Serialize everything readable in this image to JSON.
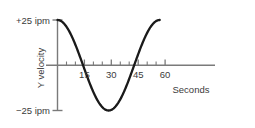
{
  "chart_data": {
    "type": "line",
    "title": "",
    "xlabel": "Seconds",
    "ylabel": "Y velocity",
    "ylim": [
      -25,
      25
    ],
    "xlim": [
      0,
      62
    ],
    "grid": false,
    "legend": null,
    "y_axis_top_label": "+25 ipm",
    "y_axis_bottom_label": "−25 ipm",
    "x_tick_labels": [
      "15",
      "30",
      "45",
      "60"
    ],
    "x_tick_values": [
      15,
      30,
      45,
      60
    ],
    "x_minor_tick_values": [
      5,
      10,
      20,
      25,
      35,
      40,
      50,
      55
    ],
    "series": [
      {
        "name": "Y velocity",
        "description": "cosine wave, amplitude 25 ipm, period 57 s, starting at +25 ipm",
        "amplitude": 25,
        "period": 57,
        "phase_start_value": 25,
        "x": [
          0,
          3,
          6,
          9,
          12,
          14.25,
          16,
          18,
          21,
          24,
          28.5,
          33,
          36,
          39,
          42,
          43.5,
          45,
          48,
          51,
          54,
          57
        ],
        "y": [
          25,
          24.3,
          22.2,
          18.9,
          14.3,
          10.5,
          6.9,
          2.2,
          -5.2,
          -12.0,
          -21.5,
          -25.0,
          -23.4,
          -19.6,
          -13.9,
          -10.5,
          -6.9,
          0.9,
          8.9,
          16.3,
          22.0
        ]
      }
    ],
    "colors": {
      "curve": "#1a1a1a",
      "axis": "#7a7a7a",
      "text": "#3b3b3b",
      "background": "#ffffff"
    }
  }
}
